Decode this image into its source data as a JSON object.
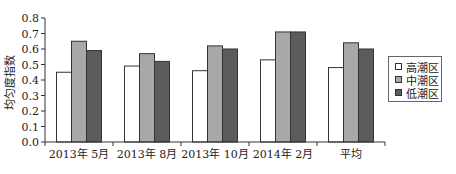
{
  "chart_data": {
    "type": "bar",
    "title": "",
    "xlabel": "",
    "ylabel": "均匀度指数",
    "ylim": [
      0.0,
      0.8
    ],
    "yticks": [
      "0.0",
      "0.1",
      "0.2",
      "0.3",
      "0.4",
      "0.5",
      "0.6",
      "0.7",
      "0.8"
    ],
    "grid": false,
    "legend_position": "right",
    "categories": [
      "2013年 5月",
      "2013年 8月",
      "2013年 10月",
      "2014年 2月",
      "平均"
    ],
    "series": [
      {
        "name": "高潮区",
        "color": "#ffffff",
        "values": [
          0.45,
          0.49,
          0.46,
          0.53,
          0.48
        ]
      },
      {
        "name": "中潮区",
        "color": "#a8a8a8",
        "values": [
          0.65,
          0.57,
          0.62,
          0.71,
          0.64
        ]
      },
      {
        "name": "低潮区",
        "color": "#5c5c5c",
        "values": [
          0.59,
          0.52,
          0.6,
          0.71,
          0.6
        ]
      }
    ]
  }
}
